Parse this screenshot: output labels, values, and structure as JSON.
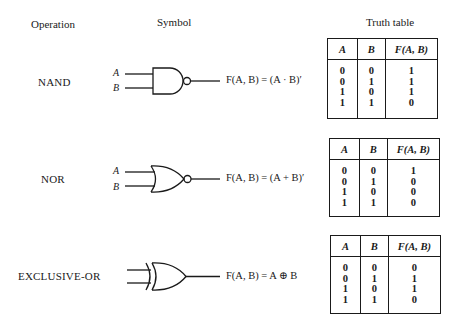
{
  "headers": {
    "operation": "Operation",
    "symbol": "Symbol",
    "truth_table": "Truth table"
  },
  "gates": [
    {
      "operation": "NAND",
      "inputs": [
        "A",
        "B"
      ],
      "expression": "F(A, B) = (A · B)′",
      "truth_table": {
        "columns": [
          "A",
          "B",
          "F(A, B)"
        ],
        "A": "0\n0\n1\n1",
        "B": "0\n1\n0\n1",
        "F": "1\n1\n1\n0",
        "rows": [
          [
            0,
            0,
            1
          ],
          [
            0,
            1,
            1
          ],
          [
            1,
            0,
            1
          ],
          [
            1,
            1,
            0
          ]
        ]
      }
    },
    {
      "operation": "NOR",
      "inputs": [
        "A",
        "B"
      ],
      "expression": "F(A, B) = (A + B)′",
      "truth_table": {
        "columns": [
          "A",
          "B",
          "F(A, B)"
        ],
        "A": "0\n0\n1\n1",
        "B": "0\n1\n0\n1",
        "F": "1\n0\n0\n0",
        "rows": [
          [
            0,
            0,
            1
          ],
          [
            0,
            1,
            0
          ],
          [
            1,
            0,
            0
          ],
          [
            1,
            1,
            0
          ]
        ]
      }
    },
    {
      "operation": "EXCLUSIVE-OR",
      "inputs": [],
      "expression": "F(A, B) = A ⊕ B",
      "truth_table": {
        "columns": [
          "A",
          "B",
          "F(A, B)"
        ],
        "A": "0\n0\n1\n1",
        "B": "0\n1\n0\n1",
        "F": "0\n1\n1\n0",
        "rows": [
          [
            0,
            0,
            0
          ],
          [
            0,
            1,
            1
          ],
          [
            1,
            0,
            1
          ],
          [
            1,
            1,
            0
          ]
        ]
      }
    }
  ]
}
